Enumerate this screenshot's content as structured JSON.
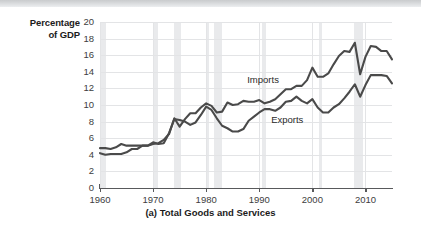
{
  "chart_data": {
    "type": "line",
    "title": "",
    "caption": "(a) Total Goods and Services",
    "ylabel": "Percentage of GDP",
    "ylabel_line1": "Percentage",
    "ylabel_line2": "of GDP",
    "xlabel": "",
    "ylim": [
      0,
      20
    ],
    "xlim": [
      1960,
      2015
    ],
    "grid": true,
    "legend_position": "inline-annotation",
    "yticks": [
      0,
      2,
      4,
      6,
      8,
      10,
      12,
      14,
      16,
      18,
      20
    ],
    "ytick_labels": [
      "0",
      "2",
      "4",
      "6",
      "8",
      "10",
      "12",
      "14",
      "16",
      "18",
      "20"
    ],
    "xticks": [
      1960,
      1970,
      1980,
      1990,
      2000,
      2010
    ],
    "xtick_labels": [
      "1960",
      "1970",
      "1980",
      "1990",
      "2000",
      "2010"
    ],
    "colors": {
      "imports": "#4a4a4a",
      "exports": "#4a4a4a",
      "recession_band": "#e9eaec",
      "gridline": "#e3e4e6",
      "axis": "#58595b",
      "text": "#1b1b1b"
    },
    "recession_bands": [
      {
        "start": 1960.2,
        "end": 1961.1
      },
      {
        "start": 1969.9,
        "end": 1970.9
      },
      {
        "start": 1973.9,
        "end": 1975.2
      },
      {
        "start": 1980.1,
        "end": 1980.6
      },
      {
        "start": 1981.5,
        "end": 1982.9
      },
      {
        "start": 1990.6,
        "end": 1991.2
      },
      {
        "start": 2001.2,
        "end": 2001.9
      },
      {
        "start": 2007.9,
        "end": 2009.5
      }
    ],
    "x": [
      1960,
      1961,
      1962,
      1963,
      1964,
      1965,
      1966,
      1967,
      1968,
      1969,
      1970,
      1971,
      1972,
      1973,
      1974,
      1975,
      1976,
      1977,
      1978,
      1979,
      1980,
      1981,
      1982,
      1983,
      1984,
      1985,
      1986,
      1987,
      1988,
      1989,
      1990,
      1991,
      1992,
      1993,
      1994,
      1995,
      1996,
      1997,
      1998,
      1999,
      2000,
      2001,
      2002,
      2003,
      2004,
      2005,
      2006,
      2007,
      2008,
      2009,
      2010,
      2011,
      2012,
      2013,
      2014,
      2015
    ],
    "series": [
      {
        "name": "Imports",
        "label": "Imports",
        "values": [
          4.2,
          4.0,
          4.1,
          4.1,
          4.1,
          4.3,
          4.7,
          4.7,
          5.1,
          5.1,
          5.3,
          5.4,
          5.8,
          6.5,
          8.4,
          7.4,
          8.3,
          9.0,
          9.0,
          9.7,
          10.2,
          9.9,
          9.1,
          9.2,
          10.3,
          10.0,
          10.1,
          10.5,
          10.4,
          10.4,
          10.6,
          10.2,
          10.4,
          10.7,
          11.3,
          11.9,
          11.9,
          12.3,
          12.3,
          13.0,
          14.5,
          13.4,
          13.4,
          13.8,
          14.9,
          15.9,
          16.5,
          16.4,
          17.5,
          13.7,
          15.8,
          17.1,
          17.0,
          16.5,
          16.5,
          15.5
        ]
      },
      {
        "name": "Exports",
        "label": "Exports",
        "values": [
          4.8,
          4.8,
          4.7,
          4.9,
          5.3,
          5.1,
          5.1,
          5.1,
          5.1,
          5.1,
          5.5,
          5.3,
          5.4,
          6.6,
          8.3,
          8.2,
          8.0,
          7.6,
          7.9,
          8.8,
          9.8,
          9.4,
          8.4,
          7.5,
          7.2,
          6.8,
          6.8,
          7.1,
          8.1,
          8.6,
          9.1,
          9.5,
          9.5,
          9.3,
          9.7,
          10.4,
          10.5,
          11.0,
          10.5,
          10.2,
          10.7,
          9.7,
          9.1,
          9.1,
          9.7,
          10.1,
          10.8,
          11.6,
          12.5,
          11.0,
          12.4,
          13.6,
          13.6,
          13.6,
          13.5,
          12.6
        ]
      }
    ],
    "annotations": [
      {
        "text": "Imports",
        "x": 1991.5,
        "y": 13.0
      },
      {
        "text": "Exports",
        "x": 1996.0,
        "y": 8.2
      }
    ]
  }
}
